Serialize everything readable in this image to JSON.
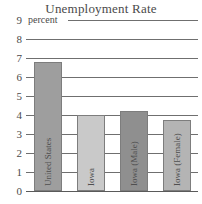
{
  "chart_data": {
    "type": "bar",
    "title": "Unemployment Rate",
    "xlabel": "",
    "ylabel": "percent",
    "ylim": [
      0,
      9
    ],
    "ytick_labels": [
      "9",
      "8",
      "7",
      "6",
      "5",
      "4",
      "3",
      "2",
      "1",
      "0"
    ],
    "ytick_values": [
      9,
      8,
      7,
      6,
      5,
      4,
      3,
      2,
      1,
      0
    ],
    "grid": true,
    "legend": "none",
    "categories": [
      "United States",
      "Iowa",
      "Iowa (Male)",
      "Iowa (Female)"
    ],
    "values": [
      6.8,
      4.0,
      4.2,
      3.75
    ],
    "bar_colors": [
      "#9e9e9e",
      "#c9c9c9",
      "#8f8f8f",
      "#b4b4b4"
    ],
    "bars": [
      {
        "label": "United States",
        "value": 6.8,
        "color": "#9e9e9e"
      },
      {
        "label": "Iowa",
        "value": 4.0,
        "color": "#c9c9c9"
      },
      {
        "label": "Iowa (Male)",
        "value": 4.2,
        "color": "#8f8f8f"
      },
      {
        "label": "Iowa (Female)",
        "value": 3.75,
        "color": "#b4b4b4"
      }
    ]
  },
  "colors": {
    "background": "#ffffff",
    "gridline": "#6f6f6f",
    "text": "#4a4a4a"
  }
}
